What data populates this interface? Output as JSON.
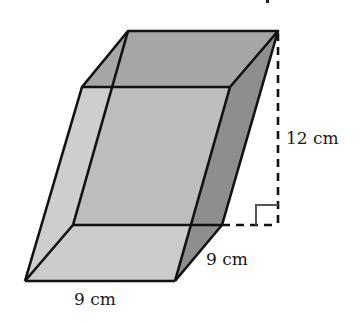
{
  "figure": {
    "type": "oblique prism (parallelepiped)",
    "labels": {
      "height": "12 cm",
      "depth": "9 cm",
      "width": "9 cm"
    },
    "colors": {
      "top_face": "#a6a6a6",
      "back_face": "#b4b4b4",
      "left_face": "#d6d6d6",
      "right_face": "#8e8e8e",
      "bottom_face": "#d2d2d2",
      "front_face": "#c4c4c4",
      "edge": "#111111"
    },
    "right_angle_marker": true
  }
}
